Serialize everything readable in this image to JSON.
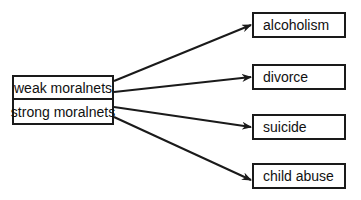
{
  "diagram": {
    "sources": [
      {
        "label": "weak moralnets"
      },
      {
        "label": "strong moralnets"
      }
    ],
    "targets": [
      {
        "label": "alcoholism"
      },
      {
        "label": "divorce"
      },
      {
        "label": "suicide"
      },
      {
        "label": "child abuse"
      }
    ],
    "edges": [
      {
        "from": "weak moralnets",
        "to": "alcoholism"
      },
      {
        "from": "weak moralnets",
        "to": "divorce"
      },
      {
        "from": "strong moralnets",
        "to": "suicide"
      },
      {
        "from": "strong moralnets",
        "to": "child abuse"
      }
    ],
    "colors": {
      "stroke": "#1a1a1a",
      "background": "#ffffff"
    }
  }
}
